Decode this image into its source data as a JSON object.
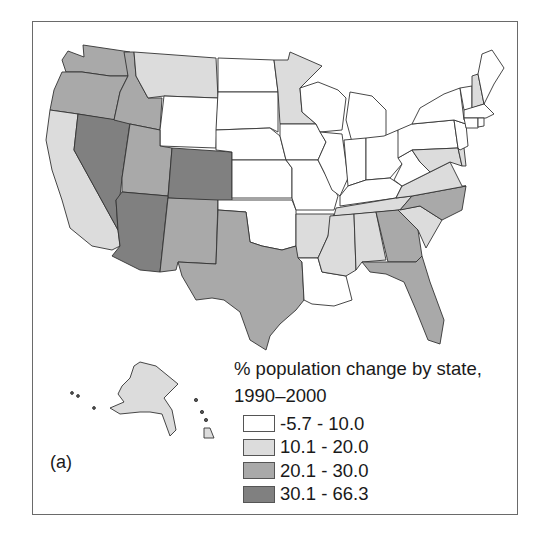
{
  "legend": {
    "title_line1": "% population change by state,",
    "title_line2": "1990–2000",
    "classes": [
      {
        "label": "-5.7 - 10.0",
        "color": "#ffffff"
      },
      {
        "label": "10.1 - 20.0",
        "color": "#dcdcdc"
      },
      {
        "label": "20.1 - 30.0",
        "color": "#a9a9a9"
      },
      {
        "label": "30.1 - 66.3",
        "color": "#808080"
      }
    ]
  },
  "panel_label": "(a)",
  "map": {
    "type": "choropleth",
    "subject": "% population change by state, 1990–2000",
    "states": {
      "WA": 2,
      "OR": 2,
      "CA": 1,
      "NV": 3,
      "ID": 2,
      "MT": 1,
      "WY": 0,
      "UT": 2,
      "CO": 3,
      "AZ": 3,
      "NM": 2,
      "TX": 2,
      "ND": 0,
      "SD": 0,
      "NE": 0,
      "KS": 0,
      "OK": 0,
      "MN": 1,
      "IA": 0,
      "MO": 0,
      "AR": 1,
      "LA": 0,
      "WI": 0,
      "IL": 0,
      "MI": 0,
      "IN": 0,
      "OH": 0,
      "KY": 0,
      "TN": 1,
      "MS": 1,
      "AL": 1,
      "GA": 2,
      "FL": 2,
      "SC": 1,
      "NC": 2,
      "VA": 1,
      "WV": 0,
      "PA": 0,
      "NY": 0,
      "VT": 0,
      "NH": 1,
      "ME": 0,
      "MA": 0,
      "RI": 0,
      "CT": 0,
      "NJ": 0,
      "DE": 1,
      "MD": 1,
      "AK": 1,
      "HI": 1
    }
  }
}
